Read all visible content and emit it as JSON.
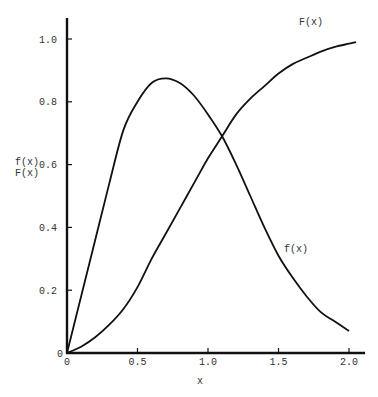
{
  "chart_data": {
    "type": "line",
    "title": "",
    "xlabel": "x",
    "ylabel": [
      "f(x)",
      "F(x)"
    ],
    "xlim": [
      0,
      2.1
    ],
    "ylim": [
      0,
      1.05
    ],
    "grid": false,
    "legend": "inline curve labels",
    "x_ticks": [
      "0",
      "0.5",
      "1.0",
      "1.5",
      "2.0"
    ],
    "y_ticks": [
      "0",
      "0.2",
      "0.4",
      "0.6",
      "0.8",
      "1.0"
    ],
    "series": [
      {
        "name": "f(x)",
        "label": "f(x)",
        "x": [
          0,
          0.1,
          0.2,
          0.3,
          0.4,
          0.5,
          0.6,
          0.7,
          0.8,
          0.9,
          1.0,
          1.1,
          1.2,
          1.3,
          1.4,
          1.5,
          1.6,
          1.7,
          1.8,
          1.9,
          2.0
        ],
        "y": [
          0,
          0.18,
          0.36,
          0.54,
          0.71,
          0.8,
          0.86,
          0.875,
          0.86,
          0.82,
          0.76,
          0.69,
          0.6,
          0.5,
          0.4,
          0.31,
          0.24,
          0.18,
          0.13,
          0.1,
          0.07
        ]
      },
      {
        "name": "F(x)",
        "label": "F(x)",
        "x": [
          0,
          0.1,
          0.2,
          0.3,
          0.4,
          0.5,
          0.6,
          0.7,
          0.8,
          0.9,
          1.0,
          1.1,
          1.2,
          1.3,
          1.4,
          1.5,
          1.6,
          1.7,
          1.8,
          1.9,
          2.0,
          2.05
        ],
        "y": [
          0,
          0.02,
          0.05,
          0.09,
          0.14,
          0.21,
          0.3,
          0.38,
          0.46,
          0.54,
          0.62,
          0.69,
          0.76,
          0.81,
          0.85,
          0.89,
          0.92,
          0.94,
          0.96,
          0.975,
          0.985,
          0.99
        ]
      }
    ],
    "annotations": [
      {
        "text": "F(x)",
        "x": 1.74,
        "y": 1.05
      },
      {
        "text": "f(x)",
        "x": 1.63,
        "y": 0.33
      }
    ]
  }
}
